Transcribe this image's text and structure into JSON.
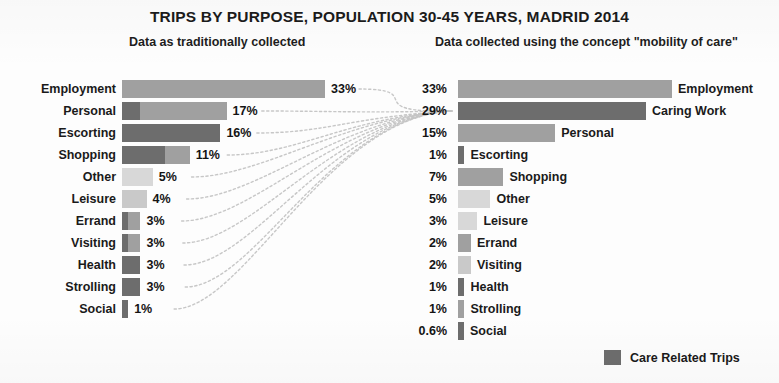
{
  "title": "TRIPS BY PURPOSE, POPULATION 30-45 YEARS, MADRID 2014",
  "panels": {
    "left": {
      "subtitle": "Data as traditionally collected"
    },
    "right": {
      "subtitle": "Data collected using the concept \"mobility of care\""
    }
  },
  "legend": {
    "label": "Care Related Trips",
    "swatch_color": "#6d6d6d",
    "base_color": "#a8a8a8"
  },
  "colors": {
    "care": "#6d6d6d",
    "mid": "#a0a0a0",
    "light": "#c9c9c9",
    "lighter": "#d8d8d8",
    "text": "#1a1a1a",
    "connector": "#c4c4c4"
  },
  "chart_data": {
    "type": "bar",
    "title": "TRIPS BY PURPOSE, POPULATION 30-45 YEARS, MADRID 2014",
    "xlabel": "",
    "ylabel": "",
    "grid": false,
    "legend_position": "bottom-right",
    "panels": [
      {
        "name": "Data as traditionally collected",
        "orientation": "horizontal",
        "label_side": "left",
        "xlim": [
          0,
          33
        ],
        "categories": [
          "Employment",
          "Personal",
          "Escorting",
          "Shopping",
          "Other",
          "Leisure",
          "Errand",
          "Visiting",
          "Health",
          "Strolling",
          "Social"
        ],
        "values": [
          33,
          17,
          16,
          11,
          5,
          4,
          3,
          3,
          3,
          3,
          1
        ],
        "value_labels": [
          "33%",
          "17%",
          "16%",
          "11%",
          "5%",
          "4%",
          "3%",
          "3%",
          "3%",
          "3%",
          "1%"
        ],
        "care_portion": [
          0,
          3,
          16,
          7,
          0,
          0,
          1,
          1,
          3,
          3,
          1
        ],
        "shades": [
          "mid",
          "mid",
          "care",
          "mid",
          "lighter",
          "light",
          "mid",
          "mid",
          "care",
          "care",
          "care"
        ]
      },
      {
        "name": "Data collected using the concept \"mobility of care\"",
        "orientation": "horizontal",
        "label_side": "right",
        "xlim": [
          0,
          33
        ],
        "categories": [
          "Employment",
          "Caring Work",
          "Personal",
          "Escorting",
          "Shopping",
          "Other",
          "Leisure",
          "Errand",
          "Visiting",
          "Health",
          "Strolling",
          "Social"
        ],
        "values": [
          33,
          29,
          15,
          1,
          7,
          5,
          3,
          2,
          2,
          1,
          1,
          0.6
        ],
        "value_labels": [
          "33%",
          "29%",
          "15%",
          "1%",
          "7%",
          "5%",
          "3%",
          "2%",
          "2%",
          "1%",
          "1%",
          "0.6%"
        ],
        "is_care": [
          false,
          true,
          false,
          false,
          false,
          false,
          false,
          false,
          false,
          false,
          false,
          false
        ],
        "shades": [
          "mid",
          "care",
          "mid",
          "care",
          "mid",
          "lighter",
          "lighter",
          "mid",
          "light",
          "care",
          "mid",
          "care"
        ]
      }
    ],
    "annotation": "Curved connectors link every left-panel category to the 'Caring Work' bar (29%) in the right panel."
  }
}
